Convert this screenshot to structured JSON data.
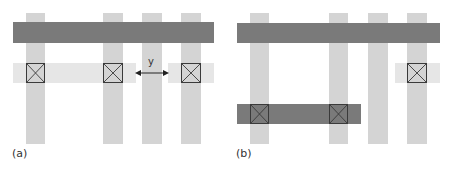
{
  "panels": [
    {
      "id": "a",
      "label": "(a)",
      "dimension_label": "y"
    },
    {
      "id": "b",
      "label": "(b)"
    }
  ],
  "colors": {
    "poly_vertical": "#d4d4d4",
    "metal_dark": "#7a7a7a",
    "diffusion_light": "#e6e6e6",
    "contact_border": "#3a3a3a"
  }
}
